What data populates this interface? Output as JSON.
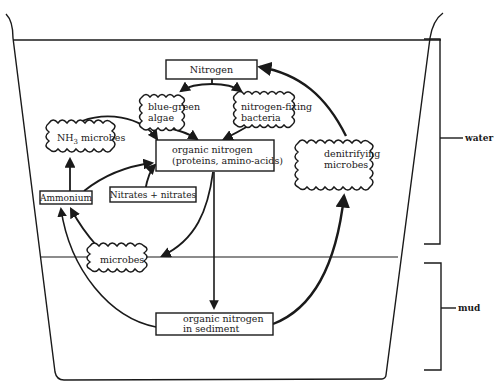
{
  "diagram": {
    "nodes": {
      "nitrogen": {
        "label": "Nitrogen",
        "shape": "box"
      },
      "blue_green_algae": {
        "line1": "blue-green",
        "line2": "algae",
        "shape": "cloud"
      },
      "nitrogen_fixing_bacteria": {
        "line1": "nitrogen-fixing",
        "line2": "bacteria",
        "shape": "cloud"
      },
      "nh3_microbes": {
        "prefix": "NH",
        "subscript": "3",
        "suffix": " microbes",
        "shape": "cloud"
      },
      "organic_nitrogen": {
        "line1": "organic nitrogen",
        "line2": "(proteins, amino-acids)",
        "shape": "box"
      },
      "ammonium": {
        "label": "Ammonium",
        "shape": "box"
      },
      "nitrates": {
        "label": "Nitrates + nitrates",
        "shape": "box"
      },
      "denitrifying_microbes": {
        "line1": "denitrifying",
        "line2": "microbes",
        "shape": "cloud"
      },
      "microbes": {
        "label": "microbes",
        "shape": "cloud"
      },
      "organic_nitrogen_sediment": {
        "line1": "organic nitrogen",
        "line2": "in sediment",
        "shape": "box"
      }
    },
    "edges": [
      {
        "from": "nitrogen",
        "to": "blue_green_algae"
      },
      {
        "from": "nitrogen",
        "to": "nitrogen_fixing_bacteria"
      },
      {
        "from": "blue_green_algae",
        "to": "organic_nitrogen"
      },
      {
        "from": "nitrogen_fixing_bacteria",
        "to": "organic_nitrogen"
      },
      {
        "from": "nh3_microbes",
        "to": "organic_nitrogen"
      },
      {
        "from": "ammonium",
        "to": "nh3_microbes"
      },
      {
        "from": "ammonium",
        "to": "organic_nitrogen"
      },
      {
        "from": "nitrates",
        "to": "organic_nitrogen"
      },
      {
        "from": "organic_nitrogen",
        "to": "microbes"
      },
      {
        "from": "organic_nitrogen",
        "to": "organic_nitrogen_sediment"
      },
      {
        "from": "microbes",
        "to": "ammonium"
      },
      {
        "from": "organic_nitrogen_sediment",
        "to": "ammonium"
      },
      {
        "from": "organic_nitrogen_sediment",
        "to": "denitrifying_microbes"
      },
      {
        "from": "denitrifying_microbes",
        "to": "nitrogen"
      }
    ],
    "zones": {
      "water": "water",
      "mud": "mud"
    }
  }
}
